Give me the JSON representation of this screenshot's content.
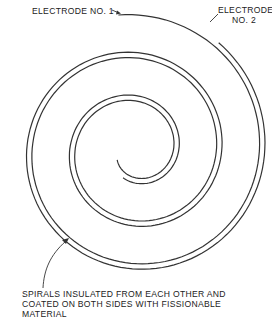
{
  "diagram": {
    "labels": {
      "electrode_1": "ELECTRODE NO. 1",
      "electrode_2": "ELECTRODE\nNO. 2",
      "spirals_note": "SPIRALS INSULATED FROM EACH OTHER AND\nCOATED ON BOTH SIDES WITH FISSIONABLE\nMATERIAL"
    },
    "spiral": {
      "center": [
        135,
        150
      ],
      "pitch_per_turn": 43,
      "stroke_color": "#333333",
      "stroke_width": 1.2,
      "electrode_1": {
        "outer_radius": 136,
        "outer_angle_deg": -97,
        "inner_radius": 20,
        "turns_note": "starts top, winds clockwise inward"
      },
      "electrode_2": {
        "outer_radius": 136,
        "outer_angle_deg": -52,
        "inner_radius": 30
      }
    }
  }
}
